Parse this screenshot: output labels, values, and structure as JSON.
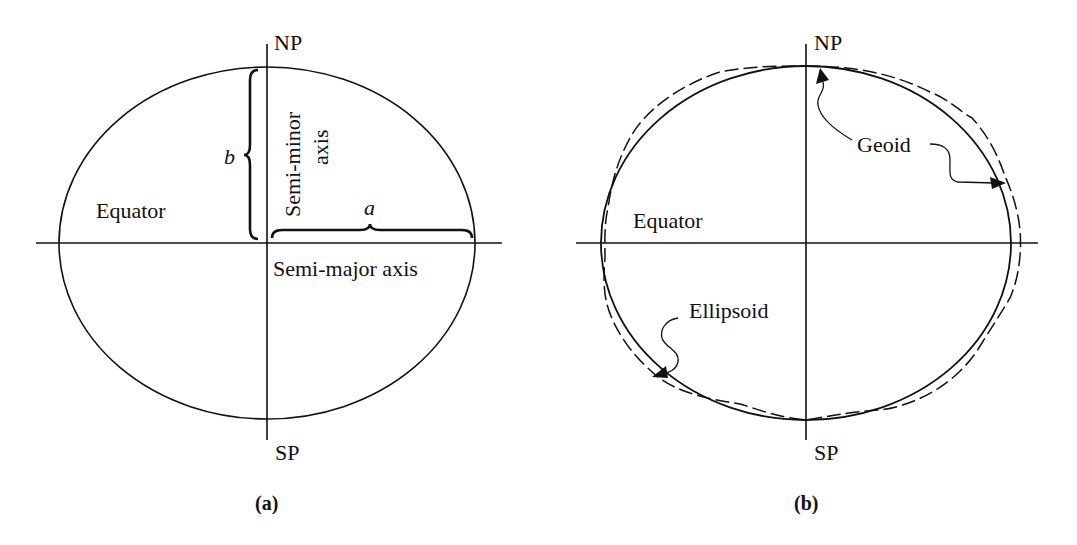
{
  "figure": {
    "panel_a": {
      "caption": "(a)",
      "north_pole": "NP",
      "south_pole": "SP",
      "equator": "Equator",
      "semi_minor_label": "Semi-minor",
      "semi_minor_label2": "axis",
      "semi_major_label": "Semi-major axis",
      "a_symbol": "a",
      "b_symbol": "b"
    },
    "panel_b": {
      "caption": "(b)",
      "north_pole": "NP",
      "south_pole": "SP",
      "equator": "Equator",
      "geoid_label": "Geoid",
      "ellipsoid_label": "Ellipsoid"
    }
  },
  "colors": {
    "ink": "#111111",
    "background": "#ffffff"
  }
}
